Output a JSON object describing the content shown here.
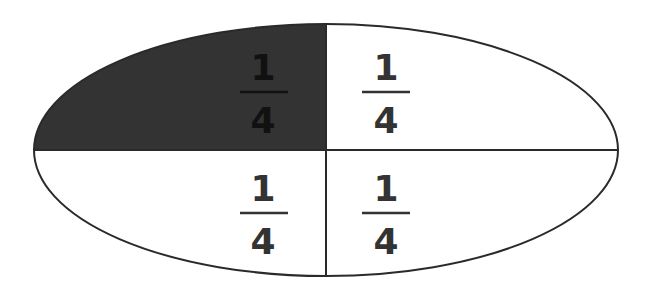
{
  "diagram": {
    "shape": "ellipse",
    "divisions": 4,
    "shaded_count": 1,
    "colors": {
      "shaded": "#333333",
      "unshaded": "#ffffff",
      "stroke": "#2a2a2a",
      "text_on_shaded": "#111111",
      "text_on_unshaded": "#333333"
    },
    "parts": [
      {
        "position": "top-left",
        "numerator": "1",
        "denominator": "4",
        "shaded": true
      },
      {
        "position": "top-right",
        "numerator": "1",
        "denominator": "4",
        "shaded": false
      },
      {
        "position": "bottom-left",
        "numerator": "1",
        "denominator": "4",
        "shaded": false
      },
      {
        "position": "bottom-right",
        "numerator": "1",
        "denominator": "4",
        "shaded": false
      }
    ]
  }
}
